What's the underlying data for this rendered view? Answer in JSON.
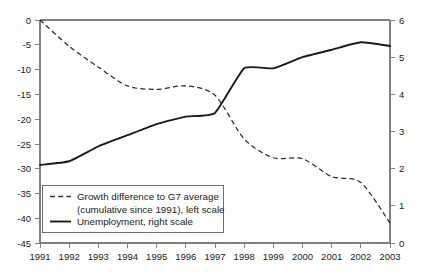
{
  "chart_data": {
    "type": "line",
    "title": "",
    "subtitle": "",
    "xlabel": "",
    "ylabel": "",
    "grid": false,
    "legend_position": "bottom-left",
    "x": [
      1991,
      1992,
      1993,
      1994,
      1995,
      1996,
      1997,
      1998,
      1999,
      2000,
      2001,
      2002,
      2003
    ],
    "categories": [
      "1991",
      "1992",
      "1993",
      "1994",
      "1995",
      "1996",
      "1997",
      "1998",
      "1999",
      "2000",
      "2001",
      "2002",
      "2003"
    ],
    "left_axis": {
      "ylim": [
        -45,
        0
      ],
      "ticks": [
        0,
        -5,
        -10,
        -15,
        -20,
        -25,
        -30,
        -35,
        -40,
        -45
      ],
      "tick_labels": [
        "0",
        "-5",
        "-10",
        "-15",
        "-20",
        "-25",
        "-30",
        "-35",
        "-40",
        "-45"
      ]
    },
    "right_axis": {
      "ylim": [
        0,
        6
      ],
      "ticks": [
        6,
        5,
        4,
        3,
        2,
        1,
        0
      ],
      "tick_labels": [
        "6",
        "5",
        "4",
        "3",
        "2",
        "1",
        "0"
      ]
    },
    "series": [
      {
        "name": "Growth difference to G7 average (cumulative since 1991), left scale",
        "axis": "left",
        "style": "dashed",
        "color": "#2b2b2b",
        "values": [
          0,
          -5.3,
          -9.5,
          -13.3,
          -14.0,
          -13.3,
          -15.2,
          -24.0,
          -27.8,
          -28.0,
          -31.6,
          -32.8,
          -41.0
        ]
      },
      {
        "name": "Unemployment, right scale",
        "axis": "right",
        "style": "solid",
        "color": "#1a1a1a",
        "values": [
          2.1,
          2.2,
          2.6,
          2.9,
          3.2,
          3.4,
          3.5,
          4.7,
          4.7,
          5.0,
          5.2,
          5.4,
          5.3
        ]
      }
    ]
  },
  "legend": {
    "entry_1_line_1": "Growth difference to G7 average",
    "entry_1_line_2": "(cumulative since 1991), left scale",
    "entry_2_line_1": "Unemployment, right scale"
  }
}
